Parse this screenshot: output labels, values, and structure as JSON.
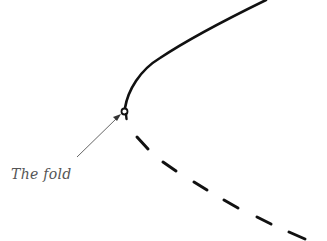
{
  "diagram": {
    "label": "The fold",
    "colors": {
      "curve": "#111111",
      "arrow": "#555555",
      "label": "#555555"
    },
    "stable_branch": "solid",
    "unstable_branch": "dashed"
  }
}
